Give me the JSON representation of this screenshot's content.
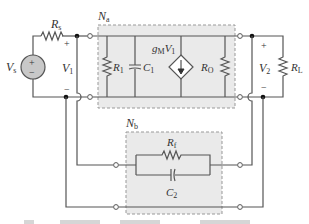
{
  "diagram": {
    "type": "circuit-schematic",
    "colors": {
      "wire": "#555555",
      "box_fill": "#eaeaea",
      "box_border": "#999999",
      "source_fill": "#c8c8c8"
    },
    "source": {
      "label": "V",
      "sub": "s",
      "plus": "+",
      "minus": "−"
    },
    "source_resistor": {
      "label": "R",
      "sub": "s"
    },
    "input_voltage": {
      "label": "V",
      "sub": "1",
      "plus": "+",
      "minus": "−"
    },
    "network_a": {
      "label": "N",
      "sub": "a",
      "components": [
        {
          "name": "R1",
          "label": "R",
          "sub": "1",
          "type": "resistor"
        },
        {
          "name": "C1",
          "label": "C",
          "sub": "1",
          "type": "capacitor"
        },
        {
          "name": "dependent-current-source",
          "label": "g",
          "sub": "M",
          "label2": "V",
          "sub2": "1",
          "type": "vccs"
        },
        {
          "name": "RO",
          "label": "R",
          "sub": "O",
          "type": "resistor"
        }
      ]
    },
    "output_voltage": {
      "label": "V",
      "sub": "2",
      "plus": "+",
      "minus": "−"
    },
    "load_resistor": {
      "label": "R",
      "sub": "L"
    },
    "network_b": {
      "label": "N",
      "sub": "b",
      "components": [
        {
          "name": "Rf",
          "label": "R",
          "sub": "f",
          "type": "resistor"
        },
        {
          "name": "C2",
          "label": "C",
          "sub": "2",
          "type": "capacitor"
        }
      ]
    },
    "caption": {
      "visible": "partial-cropped"
    }
  }
}
